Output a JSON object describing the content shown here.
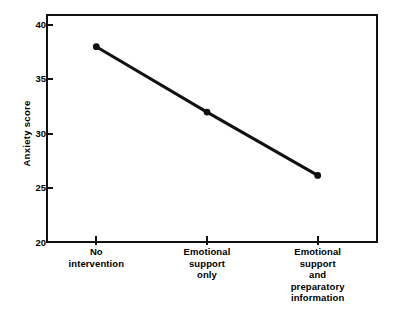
{
  "chart_data": {
    "type": "line",
    "title": "",
    "xlabel": "",
    "ylabel": "Anxiety  score",
    "categories": [
      "No\nintervention",
      "Emotional\nsupport\nonly",
      "Emotional\nsupport\nand\npreparatory\ninformation"
    ],
    "category_lines": [
      [
        "No",
        "intervention"
      ],
      [
        "Emotional",
        "support",
        "only"
      ],
      [
        "Emotional",
        "support",
        "and",
        "preparatory",
        "information"
      ]
    ],
    "values": [
      38,
      32,
      26.2
    ],
    "ylim": [
      20,
      41
    ],
    "yticks": [
      20,
      25,
      30,
      35,
      40
    ],
    "ytick_labels": [
      "20",
      "25",
      "30",
      "35",
      "40"
    ],
    "grid": false,
    "legend": null,
    "legend_position": "none",
    "marker": "filled-circle",
    "line_color": "#111111",
    "marker_color": "#111111",
    "frame_color": "#111111",
    "background_color": "#ffffff"
  },
  "figure": {
    "series_name": "Anxiety score by intervention"
  }
}
